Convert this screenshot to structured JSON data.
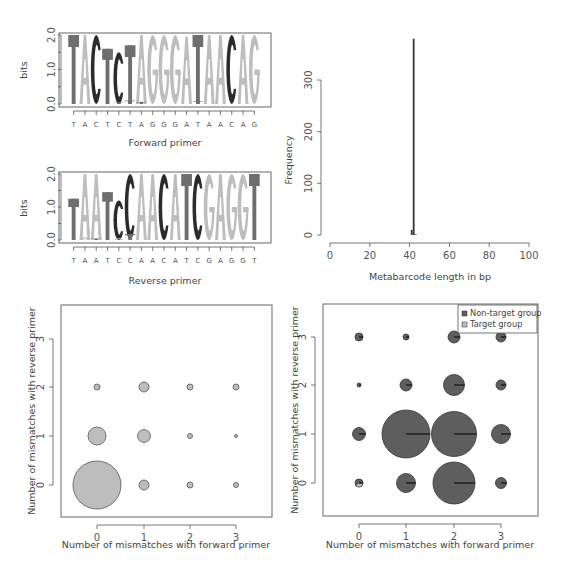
{
  "chart_data": [
    {
      "type": "sequence-logo",
      "panel": "top-left-1",
      "title": "",
      "xlabel": "Forward primer",
      "ylabel": "bits",
      "ylim": [
        0,
        2
      ],
      "yticks": [
        "0.0",
        "1.0",
        "2.0"
      ],
      "sequence": [
        "T",
        "A",
        "C",
        "T",
        "C",
        "T",
        "A",
        "G",
        "G",
        "G",
        "A",
        "T",
        "A",
        "A",
        "C",
        "A",
        "G"
      ],
      "letter_heights": [
        2.0,
        2.0,
        2.0,
        1.6,
        1.5,
        1.7,
        2.0,
        2.0,
        2.0,
        2.0,
        1.95,
        2.0,
        2.0,
        2.0,
        2.0,
        2.0,
        2.0
      ],
      "minor_letters": [
        {
          "pos": 4,
          "letter": "T",
          "height": 0.05
        },
        {
          "pos": 5,
          "letter": "T",
          "height": 0.1
        },
        {
          "pos": 6,
          "letter": "T",
          "height": 0.06
        },
        {
          "pos": 11,
          "letter": "T",
          "height": 0.08
        }
      ]
    },
    {
      "type": "sequence-logo",
      "panel": "top-left-2",
      "title": "",
      "xlabel": "Reverse primer",
      "ylabel": "bits",
      "ylim": [
        0,
        2
      ],
      "yticks": [
        "0.0",
        "1.0",
        "2.0"
      ],
      "sequence": [
        "T",
        "A",
        "A",
        "T",
        "C",
        "C",
        "A",
        "A",
        "C",
        "A",
        "T",
        "C",
        "G",
        "A",
        "G",
        "G",
        "T"
      ],
      "letter_heights": [
        1.25,
        2.0,
        2.0,
        1.45,
        1.2,
        2.0,
        2.0,
        2.0,
        2.0,
        2.0,
        2.0,
        2.0,
        2.0,
        2.0,
        2.0,
        2.0,
        2.0
      ],
      "minor_letters": [
        {
          "pos": 1,
          "letter": "A",
          "height": 0.08
        },
        {
          "pos": 2,
          "letter": "T",
          "height": 0.02
        },
        {
          "pos": 4,
          "letter": "A",
          "height": 0.05
        },
        {
          "pos": 5,
          "letter": "T",
          "height": 0.18
        }
      ]
    },
    {
      "type": "bar",
      "panel": "top-right",
      "title": "",
      "xlabel": "Metabarcode length in bp",
      "ylabel": "Frequency",
      "xlim": [
        0,
        100
      ],
      "xticks": [
        0,
        20,
        40,
        60,
        80,
        100
      ],
      "yticks": [
        0,
        100,
        200,
        300
      ],
      "x": [
        41,
        42,
        43
      ],
      "values": [
        10,
        380,
        1
      ]
    },
    {
      "type": "scatter",
      "subtype": "bubble",
      "panel": "bottom-left",
      "title": "",
      "xlabel": "Number of mismatches with forward primer",
      "ylabel": "Number of mismatches with reverse primer",
      "xticks": [
        0,
        1,
        2,
        3
      ],
      "yticks": [
        0,
        1,
        2,
        3
      ],
      "series": [
        {
          "name": "Target group",
          "points": [
            {
              "x": 0,
              "y": 0,
              "r": 24
            },
            {
              "x": 0,
              "y": 1,
              "r": 9
            },
            {
              "x": 0,
              "y": 2,
              "r": 3
            },
            {
              "x": 1,
              "y": 0,
              "r": 5
            },
            {
              "x": 1,
              "y": 1,
              "r": 6.5
            },
            {
              "x": 1,
              "y": 2,
              "r": 5
            },
            {
              "x": 2,
              "y": 0,
              "r": 3
            },
            {
              "x": 2,
              "y": 1,
              "r": 2.5
            },
            {
              "x": 2,
              "y": 2,
              "r": 3
            },
            {
              "x": 3,
              "y": 0,
              "r": 2.5
            },
            {
              "x": 3,
              "y": 1,
              "r": 1.5
            },
            {
              "x": 3,
              "y": 2,
              "r": 3
            }
          ]
        }
      ]
    },
    {
      "type": "scatter",
      "subtype": "bubble-pie",
      "panel": "bottom-right",
      "title": "",
      "xlabel": "Number of mismatches with forward primer",
      "ylabel": "Number of mismatches with reverse primer",
      "xticks": [
        0,
        1,
        2,
        3
      ],
      "yticks": [
        0,
        1,
        2,
        3
      ],
      "legend": [
        {
          "label": "Non-target group",
          "color": "#5e5e5e"
        },
        {
          "label": "Target group",
          "color": "#bdbdbd"
        }
      ],
      "legend_position": "top-right",
      "points": [
        {
          "x": 0,
          "y": 0,
          "r": 4,
          "target_fraction": 0.4
        },
        {
          "x": 0,
          "y": 1,
          "r": 6.5,
          "target_fraction": 0.0
        },
        {
          "x": 0,
          "y": 2,
          "r": 2,
          "target_fraction": 0.0
        },
        {
          "x": 0,
          "y": 3,
          "r": 4,
          "target_fraction": 0.0
        },
        {
          "x": 1,
          "y": 0,
          "r": 9.5,
          "target_fraction": 0.0
        },
        {
          "x": 1,
          "y": 1,
          "r": 24,
          "target_fraction": 0.0
        },
        {
          "x": 1,
          "y": 2,
          "r": 6,
          "target_fraction": 0.0
        },
        {
          "x": 1,
          "y": 3,
          "r": 3,
          "target_fraction": 0.0
        },
        {
          "x": 2,
          "y": 0,
          "r": 21,
          "target_fraction": 0.0
        },
        {
          "x": 2,
          "y": 1,
          "r": 22.5,
          "target_fraction": 0.0
        },
        {
          "x": 2,
          "y": 2,
          "r": 10.5,
          "target_fraction": 0.0
        },
        {
          "x": 2,
          "y": 3,
          "r": 6,
          "target_fraction": 0.0
        },
        {
          "x": 3,
          "y": 0,
          "r": 5.5,
          "target_fraction": 0.0
        },
        {
          "x": 3,
          "y": 1,
          "r": 9.5,
          "target_fraction": 0.0
        },
        {
          "x": 3,
          "y": 2,
          "r": 5,
          "target_fraction": 0.0
        },
        {
          "x": 3,
          "y": 3,
          "r": 5,
          "target_fraction": 0.0
        }
      ]
    }
  ],
  "colors": {
    "T": "#6e6e6e",
    "A": "#bdbdbd",
    "G": "#bdbdbd",
    "C": "#2b2b2b",
    "nontarget": "#5e5e5e",
    "target": "#bdbdbd",
    "axis": "#555555"
  }
}
